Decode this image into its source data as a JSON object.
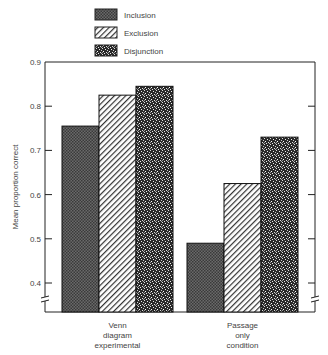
{
  "chart_data": {
    "type": "bar",
    "title": "",
    "xlabel": "",
    "ylabel": "Mean proportion correct",
    "ylim": [
      0.35,
      0.9
    ],
    "yticks": [
      "0.4",
      "0.5",
      "0.6",
      "0.7",
      "0.8",
      "0.9"
    ],
    "categories": [
      "Venn diagram experimental",
      "Passage only condition"
    ],
    "category_lines": [
      [
        "Venn",
        "diagram",
        "experimental"
      ],
      [
        "Passage",
        "only",
        "condition"
      ]
    ],
    "series": [
      {
        "name": "Inclusion",
        "values": [
          0.755,
          0.49
        ],
        "pattern": "dark-crosshatch"
      },
      {
        "name": "Exclusion",
        "values": [
          0.825,
          0.625
        ],
        "pattern": "diagonal-hatch"
      },
      {
        "name": "Disjunction",
        "values": [
          0.845,
          0.73
        ],
        "pattern": "speckle"
      }
    ],
    "legend_position": "top",
    "grid": false,
    "axis_break": true
  }
}
